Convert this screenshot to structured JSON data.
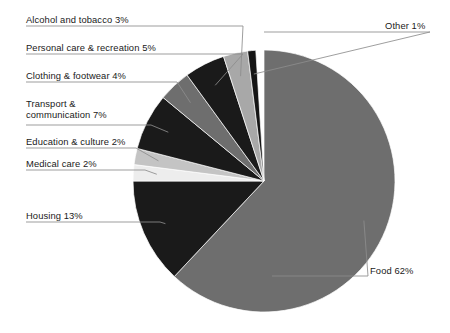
{
  "chart_data": {
    "type": "pie",
    "title": "",
    "subtitle": "",
    "xlabel": "",
    "ylabel": "",
    "legend_position": "callout-labels",
    "grid": false,
    "units": "percent",
    "total": 100,
    "start_angle_deg": 0,
    "direction": "clockwise",
    "categories": [
      "Food",
      "Housing",
      "Medical care",
      "Education & culture",
      "Transport & communication",
      "Clothing & footwear",
      "Personal care & recreation",
      "Alcohol and tobacco",
      "Other"
    ],
    "values": [
      62,
      13,
      2,
      2,
      7,
      4,
      5,
      3,
      1
    ],
    "slices": [
      {
        "name": "Food",
        "label": "Food 62%",
        "value": 62,
        "color": "#6e6e6e",
        "label_x": 370,
        "label_y": 265,
        "leader_from_x": 272,
        "leader_from_y": 276,
        "leader_to_x": 368,
        "leader_to_y": 276,
        "align": "left"
      },
      {
        "name": "Housing",
        "label": "Housing 13%",
        "value": 13,
        "color": "#1a1a1a",
        "label_x": 26,
        "label_y": 210,
        "leader_from_x": 26,
        "leader_from_y": 222,
        "leader_to_x": 160,
        "leader_to_y": 222,
        "align": "left"
      },
      {
        "name": "Medical care",
        "label": "Medical care 2%",
        "value": 2,
        "color": "#ededed",
        "label_x": 26,
        "label_y": 158,
        "leader_from_x": 26,
        "leader_from_y": 170,
        "leader_to_x": 145,
        "leader_to_y": 170,
        "align": "left"
      },
      {
        "name": "Education & culture",
        "label": "Education & culture 2%",
        "value": 2,
        "color": "#c4c4c4",
        "label_x": 26,
        "label_y": 136,
        "leader_from_x": 26,
        "leader_from_y": 148,
        "leader_to_x": 136,
        "leader_to_y": 148,
        "align": "left"
      },
      {
        "name": "Transport & communication",
        "label": "Transport &\ncommunication 7%",
        "value": 7,
        "color": "#1a1a1a",
        "label_x": 26,
        "label_y": 98,
        "leader_from_x": 26,
        "leader_from_y": 125,
        "leader_to_x": 151,
        "leader_to_y": 125,
        "align": "left"
      },
      {
        "name": "Clothing & footwear",
        "label": "Clothing & footwear 4%",
        "value": 4,
        "color": "#6e6e6e",
        "label_x": 26,
        "label_y": 70,
        "leader_from_x": 26,
        "leader_from_y": 82,
        "leader_to_x": 177,
        "leader_to_y": 82,
        "align": "left"
      },
      {
        "name": "Personal care & recreation",
        "label": "Personal care & recreation 5%",
        "value": 5,
        "color": "#1a1a1a",
        "label_x": 26,
        "label_y": 42,
        "leader_from_x": 26,
        "leader_from_y": 54,
        "leader_to_x": 243,
        "leader_to_y": 54,
        "align": "left"
      },
      {
        "name": "Alcohol and tobacco",
        "label": "Alcohol and tobacco 3%",
        "value": 3,
        "color": "#a8a8a8",
        "label_x": 26,
        "label_y": 14,
        "leader_from_x": 26,
        "leader_from_y": 26,
        "leader_to_x": 243,
        "leader_to_y": 26,
        "align": "left"
      },
      {
        "name": "Other",
        "label": "Other 1%",
        "value": 1,
        "color": "#151515",
        "label_x": 385,
        "label_y": 20,
        "leader_from_x": 264,
        "leader_from_y": 32,
        "leader_to_x": 430,
        "leader_to_y": 32,
        "align": "left"
      }
    ],
    "geometry": {
      "center_x": 264,
      "center_y": 181,
      "radius": 131
    },
    "colors": {
      "dark": "#1a1a1a",
      "mid_gray": "#6e6e6e",
      "light_gray": "#c4c4c4",
      "very_light": "#ededed",
      "leader_line": "#8c8c8c",
      "background": "#ffffff",
      "text": "#1a1a1a"
    }
  }
}
